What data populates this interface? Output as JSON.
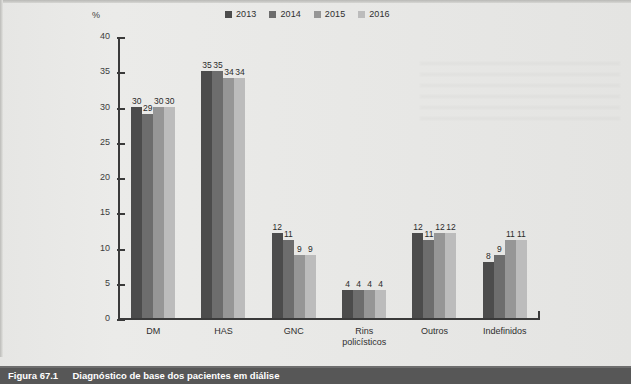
{
  "figure": {
    "caption_number": "Figura 67.1",
    "caption_title": "Diagnóstico de base dos pacientes em diálise"
  },
  "chart_data": {
    "type": "bar",
    "title": "",
    "xlabel": "",
    "ylabel": "%",
    "unit_label": "%",
    "ylim": [
      0,
      40
    ],
    "ytick_step": 5,
    "yticks": [
      "40",
      "35",
      "30",
      "25",
      "20",
      "15",
      "10",
      "5",
      "0"
    ],
    "grid": false,
    "legend_position": "top-center",
    "categories": [
      "DM",
      "HAS",
      "GNC",
      "Rins policísticos",
      "Outros",
      "Indefinidos"
    ],
    "category_lines": [
      [
        "DM"
      ],
      [
        "HAS"
      ],
      [
        "GNC"
      ],
      [
        "Rins",
        "policísticos"
      ],
      [
        "Outros"
      ],
      [
        "Indefinidos"
      ]
    ],
    "series": [
      {
        "name": "2013",
        "color": "#4c4c4c",
        "values": [
          30,
          35,
          12,
          4,
          12,
          8
        ]
      },
      {
        "name": "2014",
        "color": "#6d6d6d",
        "values": [
          29,
          35,
          11,
          4,
          11,
          9
        ]
      },
      {
        "name": "2015",
        "color": "#969696",
        "values": [
          30,
          34,
          9,
          4,
          12,
          11
        ]
      },
      {
        "name": "2016",
        "color": "#bcbcbc",
        "values": [
          30,
          34,
          9,
          4,
          12,
          11
        ]
      }
    ]
  }
}
